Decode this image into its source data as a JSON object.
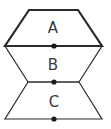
{
  "diagram": {
    "width": 111,
    "height": 129,
    "stroke_color": "#2b2b2b",
    "dot_color": "#1a1a1a",
    "regions": [
      {
        "label": "A",
        "points": "29,10 78,10 102,46 5,46",
        "label_x": 53,
        "label_y": 33,
        "stroke_width": 2.2
      },
      {
        "label": "B",
        "points": "5,46 102,46 79,82 28,82",
        "label_x": 53,
        "label_y": 70,
        "stroke_width": 1.2
      },
      {
        "label": "C",
        "points": "28,82 79,82 102,119 5,119",
        "label_x": 54,
        "label_y": 107,
        "stroke_width": 1.2
      }
    ],
    "dots": [
      {
        "name": "dot-ab",
        "x": 54,
        "y": 46
      },
      {
        "name": "dot-bc",
        "x": 54,
        "y": 82
      },
      {
        "name": "dot-bottom",
        "x": 54,
        "y": 119
      }
    ]
  }
}
